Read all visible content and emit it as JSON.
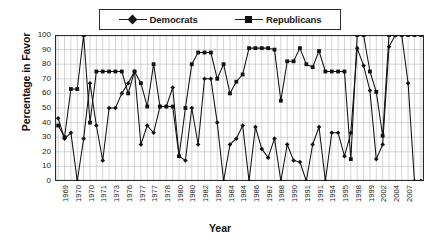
{
  "chart_data": {
    "type": "line",
    "title": "",
    "xlabel": "Year",
    "ylabel": "Percentage in Favor",
    "ylim": [
      0,
      100
    ],
    "ytick_labels": [
      "100",
      "90",
      "80",
      "70",
      "60",
      "50",
      "40",
      "30",
      "20",
      "10",
      "0"
    ],
    "ytick_values": [
      100,
      90,
      80,
      70,
      60,
      50,
      40,
      30,
      20,
      10,
      0
    ],
    "grid": true,
    "grid_vertical": true,
    "legend_position": "top-center",
    "x_tick_labels": [
      "1969",
      "1970",
      "1970",
      "1971",
      "1973",
      "1976",
      "1977",
      "1977",
      "1978",
      "1980",
      "1980",
      "1982",
      "1982",
      "1984",
      "1984",
      "1986",
      "1987",
      "1988",
      "1990",
      "1991",
      "1991",
      "1994",
      "1995",
      "1998",
      "1999",
      "2002",
      "2004",
      "2007"
    ],
    "x_tick_every": 2,
    "categories": [
      "1969",
      "1969",
      "1970",
      "1970",
      "1970",
      "1970",
      "1970",
      "1971",
      "1971",
      "1971",
      "1973",
      "1973",
      "1976",
      "1976",
      "1976",
      "1977",
      "1977",
      "1977",
      "1977",
      "1978",
      "1978",
      "1978",
      "1980",
      "1980",
      "1980",
      "1980",
      "1982",
      "1982",
      "1982",
      "1982",
      "1984",
      "1984",
      "1984",
      "1984",
      "1986",
      "1986",
      "1987",
      "1987",
      "1988",
      "1988",
      "1990",
      "1990",
      "1991",
      "1991",
      "1991",
      "1994",
      "1994",
      "1995",
      "1995",
      "1998",
      "1998",
      "1999",
      "1999",
      "2002",
      "2002",
      "2004",
      "2004",
      "2007"
    ],
    "series": [
      {
        "name": "Democrats",
        "marker": "diamond",
        "color": "#111111",
        "values": [
          43,
          29,
          33,
          0,
          29,
          67,
          38,
          14,
          50,
          50,
          60,
          67,
          75,
          25,
          38,
          33,
          51,
          51,
          64,
          17,
          14,
          50,
          25,
          70,
          70,
          40,
          0,
          25,
          29,
          38,
          0,
          37,
          22,
          16,
          29,
          0,
          25,
          14,
          13,
          0,
          25,
          37,
          0,
          33,
          33,
          17,
          33,
          91,
          79,
          62,
          15,
          25,
          92,
          100,
          100,
          67,
          0,
          0
        ]
      },
      {
        "name": "Republicans",
        "marker": "square",
        "color": "#111111",
        "values": [
          38,
          30,
          63,
          63,
          100,
          40,
          75,
          75,
          75,
          75,
          75,
          60,
          75,
          67,
          51,
          80,
          51,
          51,
          51,
          17,
          50,
          80,
          88,
          88,
          88,
          70,
          80,
          60,
          68,
          73,
          91,
          91,
          91,
          91,
          90,
          55,
          82,
          82,
          91,
          80,
          78,
          89,
          75,
          75,
          75,
          75,
          15,
          100,
          100,
          75,
          61,
          31,
          100,
          100,
          100,
          100,
          100,
          100
        ]
      }
    ]
  },
  "legend": {
    "entries": [
      {
        "label": "Democrats",
        "marker": "diamond"
      },
      {
        "label": "Republicans",
        "marker": "square"
      }
    ]
  }
}
